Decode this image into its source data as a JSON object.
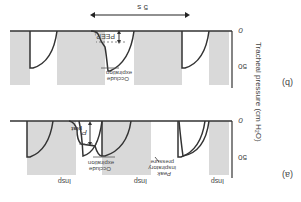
{
  "figure": {
    "orientation": "rotated 180 degrees",
    "y_axis_label": "Tracheal pressure (cm H₂O)",
    "panels": [
      {
        "id": "a",
        "label": "(a)",
        "tick_labels": [
          "0",
          "50"
        ],
        "annotations": {
          "peak": "Peak inspiratory pressure",
          "peak_line1": "Peak",
          "peak_line2": "inspiratory",
          "peak_line3": "pressure",
          "occlude": "Occlude expiration",
          "occlude_line1": "Occlude",
          "occlude_line2": "expiration",
          "p_plat": "P plat",
          "p": "P",
          "plat": "plat"
        },
        "insp_labels": [
          "Insp",
          "Insp",
          "Insp"
        ]
      },
      {
        "id": "b",
        "label": "(b)",
        "tick_labels": [
          "0",
          "50"
        ],
        "annotations": {
          "occlude_line1": "Occlude",
          "occlude_line2": "expiration",
          "peep": "PEEP",
          "peep_sub": "i",
          "duration": "5 s"
        }
      }
    ],
    "colors": {
      "band": "#d9d9d9",
      "trace": "#333333",
      "axis": "#333333",
      "text": "#444444"
    }
  }
}
